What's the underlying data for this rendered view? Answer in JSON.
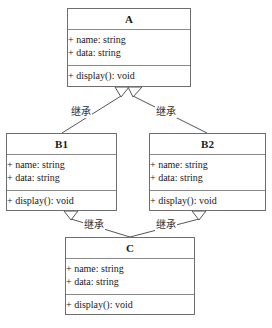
{
  "classes": {
    "A": {
      "name": "A",
      "attributes": [
        "+ name: string",
        "+ data: string"
      ],
      "operations": [
        "+ display(): void"
      ]
    },
    "B1": {
      "name": "B1",
      "attributes": [
        "+ name: string",
        "+ data: string"
      ],
      "operations": [
        "+ display(): void"
      ]
    },
    "B2": {
      "name": "B2",
      "attributes": [
        "+ name: string",
        "+ data: string"
      ],
      "operations": [
        "+ display(): void"
      ]
    },
    "C": {
      "name": "C",
      "attributes": [
        "+ name: string",
        "+ data: string"
      ],
      "operations": [
        "+ display(): void"
      ]
    }
  },
  "relations": [
    {
      "from": "B1",
      "to": "A",
      "type": "generalization",
      "label": "继承"
    },
    {
      "from": "B2",
      "to": "A",
      "type": "generalization",
      "label": "继承"
    },
    {
      "from": "C",
      "to": "B1",
      "type": "generalization",
      "label": "继承"
    },
    {
      "from": "C",
      "to": "B2",
      "type": "generalization",
      "label": "继承"
    }
  ],
  "colors": {
    "border": "#6e6e6e",
    "divider": "#8a8a8a",
    "text": "#1a1a1a",
    "background": "#ffffff"
  }
}
